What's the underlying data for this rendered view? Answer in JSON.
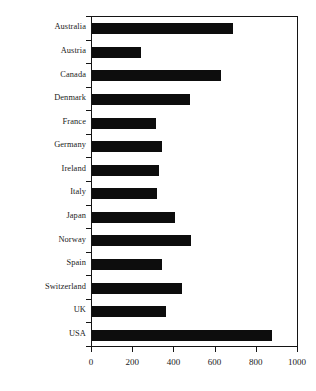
{
  "chart_data": {
    "type": "bar",
    "orientation": "horizontal",
    "title": "",
    "subtitle": "",
    "xlabel": "",
    "ylabel": "",
    "xlim": [
      0,
      1000
    ],
    "ylim": null,
    "grid": false,
    "legend": null,
    "legend_position": "none",
    "bar_color": "#0d0d0d",
    "axis_color": "#141414",
    "background": "#ffffff",
    "xticks": [
      0,
      200,
      400,
      600,
      800,
      1000
    ],
    "xtick_labels": [
      "0",
      "200",
      "400",
      "600",
      "800",
      "1000"
    ],
    "categories": [
      "Australia",
      "Austria",
      "Canada",
      "Denmark",
      "France",
      "Germany",
      "Ireland",
      "Italy",
      "Japan",
      "Norway",
      "Spain",
      "Switzerland",
      "UK",
      "USA"
    ],
    "values": [
      686,
      237,
      628,
      478,
      310,
      338,
      324,
      314,
      401,
      483,
      338,
      435,
      358,
      874
    ]
  }
}
